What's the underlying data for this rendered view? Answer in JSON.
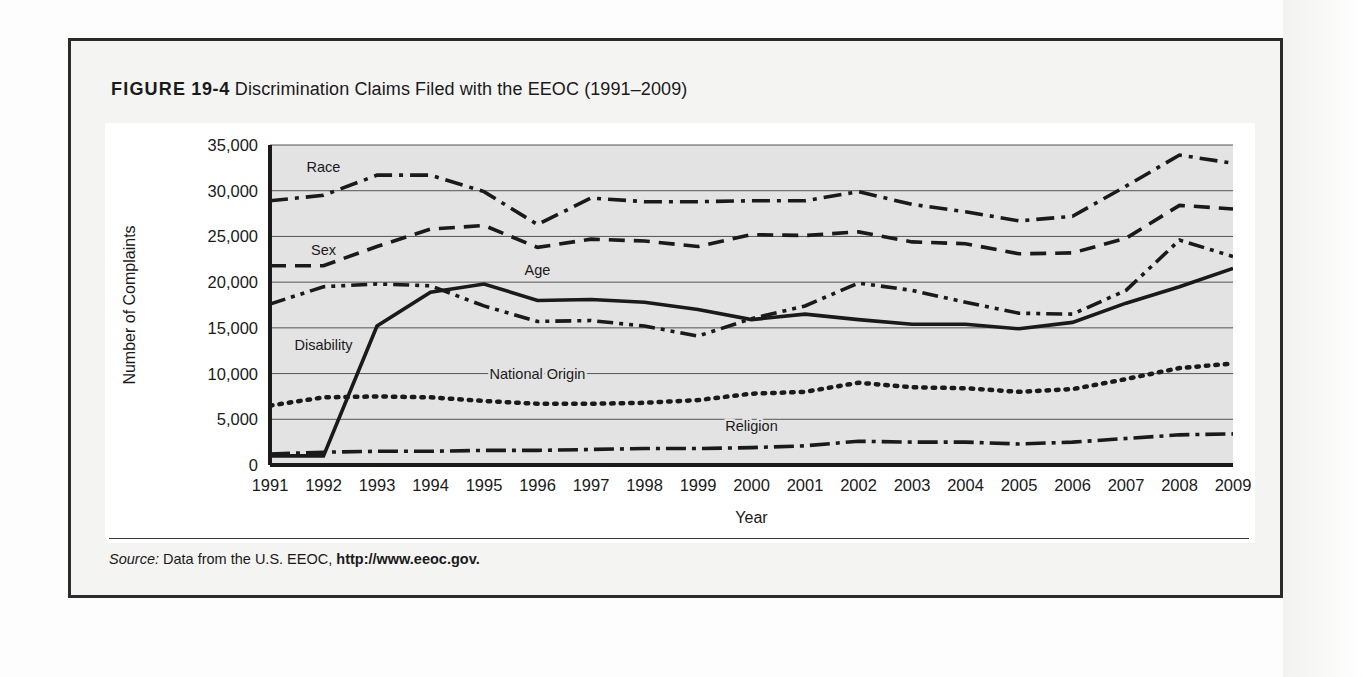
{
  "figure": {
    "label": "FIGURE",
    "number": "19-4",
    "title": "Discrimination Claims Filed with the EEOC (1991–2009)",
    "full_title": "FIGURE 19-4 Discrimination Claims Filed with the EEOC (1991–2009)",
    "source_prefix": "Source:",
    "source_text": "Data from the U.S. EEOC,",
    "source_url": "http://www.eeoc.gov."
  },
  "colors": {
    "ink": "#1a1a1a",
    "plot_background": "#e3e3e3",
    "gridline": "#555555",
    "frame": "#2b2b2b",
    "page": "#f4f4f2"
  },
  "chart_data": {
    "type": "line",
    "title": "Discrimination Claims Filed with the EEOC (1991–2009)",
    "xlabel": "Year",
    "ylabel": "Number of Complaints",
    "categories": [
      "1991",
      "1992",
      "1993",
      "1994",
      "1995",
      "1996",
      "1997",
      "1998",
      "1999",
      "2000",
      "2001",
      "2002",
      "2003",
      "2004",
      "2005",
      "2006",
      "2007",
      "2008",
      "2009"
    ],
    "x": [
      1991,
      1992,
      1993,
      1994,
      1995,
      1996,
      1997,
      1998,
      1999,
      2000,
      2001,
      2002,
      2003,
      2004,
      2005,
      2006,
      2007,
      2008,
      2009
    ],
    "ylim": [
      0,
      35000
    ],
    "xlim": [
      1991,
      2009
    ],
    "yticks": [
      0,
      5000,
      10000,
      15000,
      20000,
      25000,
      30000,
      35000
    ],
    "ytick_labels": [
      "0",
      "5,000",
      "10,000",
      "15,000",
      "20,000",
      "25,000",
      "30,000",
      "35,000"
    ],
    "grid": true,
    "legend": "inline-labels",
    "series": [
      {
        "name": "Race",
        "style": "dash-dot",
        "label_x": 1992,
        "label_y": 32000,
        "values": [
          28900,
          29500,
          31700,
          31700,
          29900,
          26300,
          29200,
          28800,
          28800,
          28900,
          28900,
          29900,
          28500,
          27700,
          26700,
          27200,
          30500,
          33900,
          33000
        ]
      },
      {
        "name": "Sex",
        "style": "dashed",
        "label_x": 1992,
        "label_y": 23000,
        "values": [
          21800,
          21800,
          23900,
          25800,
          26200,
          23800,
          24700,
          24500,
          23900,
          25200,
          25100,
          25500,
          24400,
          24200,
          23100,
          23200,
          24800,
          28400,
          28000
        ]
      },
      {
        "name": "Age",
        "style": "dash-dot-dot",
        "label_x": 1996,
        "label_y": 20800,
        "values": [
          17600,
          19500,
          19800,
          19600,
          17400,
          15700,
          15800,
          15200,
          14100,
          16000,
          17400,
          19900,
          19100,
          17800,
          16600,
          16500,
          19100,
          24600,
          22800
        ]
      },
      {
        "name": "Disability",
        "style": "solid",
        "label_x": 1992,
        "label_y": 12600,
        "values": [
          1000,
          1000,
          15200,
          18900,
          19800,
          18000,
          18100,
          17800,
          17000,
          15900,
          16500,
          15900,
          15400,
          15400,
          14900,
          15600,
          17700,
          19500,
          21500
        ]
      },
      {
        "name": "National Origin",
        "style": "dotted",
        "label_x": 1996,
        "label_y": 9400,
        "values": [
          6500,
          7400,
          7500,
          7400,
          7000,
          6700,
          6700,
          6800,
          7100,
          7800,
          8000,
          9000,
          8500,
          8400,
          8000,
          8300,
          9400,
          10600,
          11100
        ]
      },
      {
        "name": "Religion",
        "style": "long-dash-dot",
        "label_x": 2000,
        "label_y": 3700,
        "values": [
          1200,
          1400,
          1500,
          1500,
          1600,
          1600,
          1700,
          1800,
          1800,
          1900,
          2100,
          2600,
          2500,
          2500,
          2300,
          2500,
          2900,
          3300,
          3400
        ]
      }
    ]
  }
}
